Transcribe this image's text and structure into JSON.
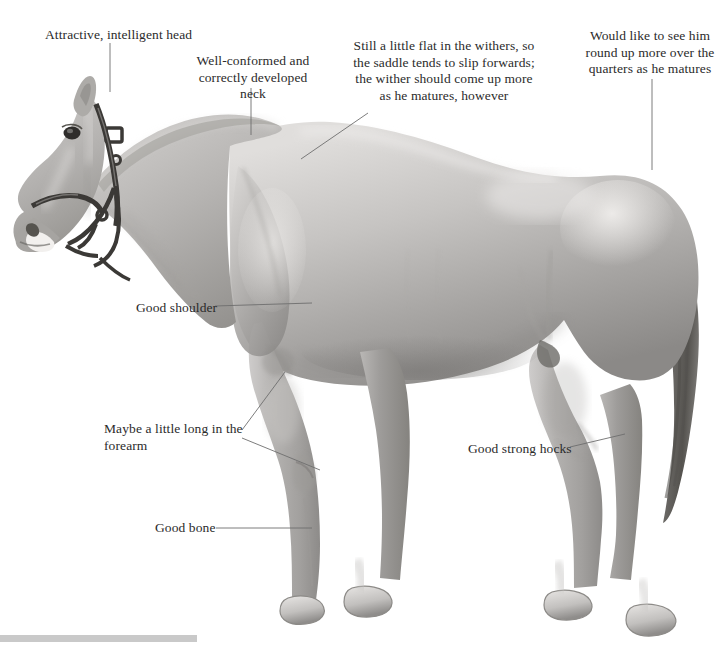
{
  "figure": {
    "background_color": "#ffffff",
    "text_color": "#2b2b2b",
    "leader_line_color": "#6e6e6e"
  },
  "annotations": [
    {
      "id": "head",
      "name": "annotation-head",
      "text": "Attractive, intelligent head",
      "align": "left",
      "x": 45,
      "y": 27,
      "width": 200
    },
    {
      "id": "neck",
      "name": "annotation-neck",
      "text": "Well-conformed and\ncorrectly developed neck",
      "align": "center",
      "x": 188,
      "y": 53,
      "width": 130
    },
    {
      "id": "withers",
      "name": "annotation-withers",
      "text": "Still a little flat in the withers, so\nthe saddle tends to slip forwards;\nthe wither should come up more\nas he matures, however",
      "align": "center",
      "x": 335,
      "y": 38,
      "width": 218
    },
    {
      "id": "quarters",
      "name": "annotation-quarters",
      "text": "Would like to see him\nround up more over the\nquarters as he matures",
      "align": "center",
      "x": 576,
      "y": 28,
      "width": 148
    },
    {
      "id": "shoulder",
      "name": "annotation-shoulder",
      "text": "Good shoulder",
      "align": "left",
      "x": 136,
      "y": 300,
      "width": 120
    },
    {
      "id": "forearm",
      "name": "annotation-forearm",
      "text": "Maybe a little long in the\nforearm",
      "align": "left",
      "x": 104,
      "y": 421,
      "width": 150
    },
    {
      "id": "hocks",
      "name": "annotation-hocks",
      "text": "Good strong hocks",
      "align": "left",
      "x": 468,
      "y": 441,
      "width": 130
    },
    {
      "id": "bone",
      "name": "annotation-bone",
      "text": "Good bone",
      "align": "left",
      "x": 155,
      "y": 520,
      "width": 100
    }
  ],
  "leader_lines": [
    {
      "id": "head-leader",
      "name": "leader-line-head",
      "points": "110,43 110,92"
    },
    {
      "id": "neck-leader",
      "name": "leader-line-neck",
      "points": "251,88 251,135"
    },
    {
      "id": "withers-leader",
      "name": "leader-line-withers",
      "points": "368,113 301,159"
    },
    {
      "id": "quarters-leader",
      "name": "leader-line-quarters",
      "points": "652,79 652,170"
    },
    {
      "id": "shoulder-leader",
      "name": "leader-line-shoulder",
      "points": "215,306 312,303"
    },
    {
      "id": "forearm-leader-upper",
      "name": "leader-line-forearm-elbow",
      "points": "242,430 285,372"
    },
    {
      "id": "forearm-leader-lower",
      "name": "leader-line-forearm-knee",
      "points": "242,438 320,470"
    },
    {
      "id": "hocks-leader",
      "name": "leader-line-hocks",
      "points": "570,447 625,434"
    },
    {
      "id": "bone-leader",
      "name": "leader-line-bone",
      "points": "216,528 312,528"
    }
  ]
}
